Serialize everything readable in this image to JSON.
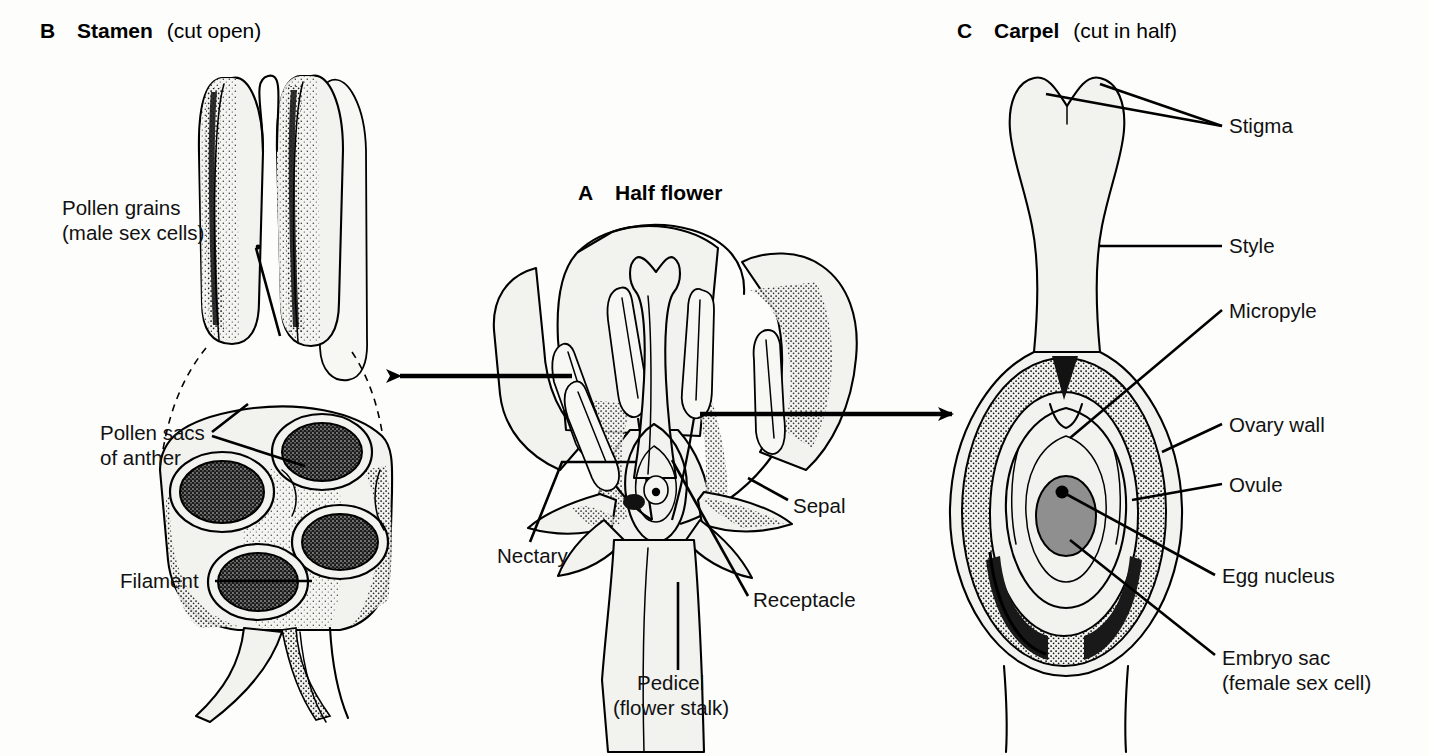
{
  "figure": {
    "kind": "botanical-diagram",
    "background_color": "#fdfdfc",
    "ink_color": "#000000"
  },
  "panels": {
    "stamen": {
      "letter": "B",
      "title_bold": "Stamen",
      "title_rest": "(cut open)",
      "labels": [
        {
          "id": "pollen-grains",
          "line1": "Pollen grains",
          "line2": "(male sex cells)"
        },
        {
          "id": "pollen-sacs",
          "line1": "Pollen sacs",
          "line2": "of anther"
        },
        {
          "id": "filament",
          "line1": "Filament",
          "line2": ""
        }
      ]
    },
    "half_flower": {
      "letter": "A",
      "title_bold": "Half flower",
      "title_rest": "",
      "labels": [
        {
          "id": "sepal",
          "line1": "Sepal",
          "line2": ""
        },
        {
          "id": "nectary",
          "line1": "Nectary",
          "line2": ""
        },
        {
          "id": "receptacle",
          "line1": "Receptacle",
          "line2": ""
        },
        {
          "id": "pedicel",
          "line1": "Pedicel",
          "line2": "(flower stalk)"
        }
      ]
    },
    "carpel": {
      "letter": "C",
      "title_bold": "Carpel",
      "title_rest": "(cut in half)",
      "labels": [
        {
          "id": "stigma",
          "line1": "Stigma",
          "line2": ""
        },
        {
          "id": "style",
          "line1": "Style",
          "line2": ""
        },
        {
          "id": "micropyle",
          "line1": "Micropyle",
          "line2": ""
        },
        {
          "id": "ovary-wall",
          "line1": "Ovary wall",
          "line2": ""
        },
        {
          "id": "ovule",
          "line1": "Ovule",
          "line2": ""
        },
        {
          "id": "egg-nucleus",
          "line1": "Egg nucleus",
          "line2": ""
        },
        {
          "id": "embryo-sac",
          "line1": "Embryo sac",
          "line2": "(female sex cell)"
        }
      ]
    }
  },
  "connectors": {
    "flower_to_stamen": "arrow-left",
    "flower_to_carpel": "arrow-right"
  }
}
